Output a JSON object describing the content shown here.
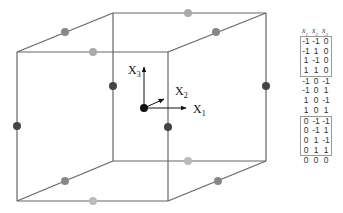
{
  "diagram": {
    "title": "",
    "axes": [
      {
        "name": "x1",
        "label": "X",
        "sub": "1"
      },
      {
        "name": "x2",
        "label": "X",
        "sub": "2"
      },
      {
        "name": "x3",
        "label": "X",
        "sub": "3"
      }
    ],
    "colors": {
      "edge": "#666666",
      "center_point": "#111111",
      "dark_point": "#444444",
      "mid_point": "#888888",
      "light_point": "#aaaaaa"
    }
  },
  "table": {
    "headers": [
      {
        "label": "x",
        "sub": "1"
      },
      {
        "label": "x",
        "sub": "2"
      },
      {
        "label": "x",
        "sub": "3"
      }
    ],
    "groups": [
      {
        "boxed": true,
        "rows": [
          [
            "-1",
            "-1",
            "0"
          ],
          [
            "-1",
            "1",
            "0"
          ],
          [
            "1",
            "-1",
            "0"
          ],
          [
            "1",
            "1",
            "0"
          ]
        ]
      },
      {
        "boxed": false,
        "rows": [
          [
            "-1",
            "0",
            "-1"
          ],
          [
            "-1",
            "0",
            "1"
          ],
          [
            "1",
            "0",
            "-1"
          ],
          [
            "1",
            "0",
            "1"
          ]
        ]
      },
      {
        "boxed": true,
        "rows": [
          [
            "0",
            "-1",
            "-1"
          ],
          [
            "0",
            "-1",
            "1"
          ],
          [
            "0",
            "1",
            "-1"
          ],
          [
            "0",
            "1",
            "1"
          ]
        ]
      },
      {
        "boxed": false,
        "rows": [
          [
            "0",
            "0",
            "0"
          ]
        ]
      }
    ]
  }
}
